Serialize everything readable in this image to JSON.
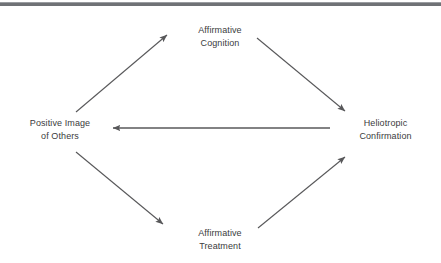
{
  "figure": {
    "type": "cycle-diagram",
    "background_color": "#ffffff",
    "rule_color": "#6f7276",
    "arrow_color": "#58585a",
    "text_color": "#3b3b3d",
    "nodes": [
      {
        "id": "affirmative-cognition",
        "position": "top",
        "line1": "Affirmative",
        "line2": "Cognition"
      },
      {
        "id": "heliotropic-confirmation",
        "position": "right",
        "line1": "Heliotropic",
        "line2": "Confirmation"
      },
      {
        "id": "positive-image-of-others",
        "position": "left",
        "line1": "Positive Image",
        "line2": "of Others"
      },
      {
        "id": "affirmative-treatment",
        "position": "bottom",
        "line1": "Affirmative",
        "line2": "Treatment"
      }
    ],
    "edges": [
      {
        "id": "positive-to-cognition",
        "from": "positive-image-of-others",
        "to": "affirmative-cognition"
      },
      {
        "id": "cognition-to-heliotropic",
        "from": "affirmative-cognition",
        "to": "heliotropic-confirmation"
      },
      {
        "id": "heliotropic-to-positive",
        "from": "heliotropic-confirmation",
        "to": "positive-image-of-others"
      },
      {
        "id": "positive-to-treatment",
        "from": "positive-image-of-others",
        "to": "affirmative-treatment"
      },
      {
        "id": "treatment-to-heliotropic",
        "from": "affirmative-treatment",
        "to": "heliotropic-confirmation"
      }
    ]
  }
}
